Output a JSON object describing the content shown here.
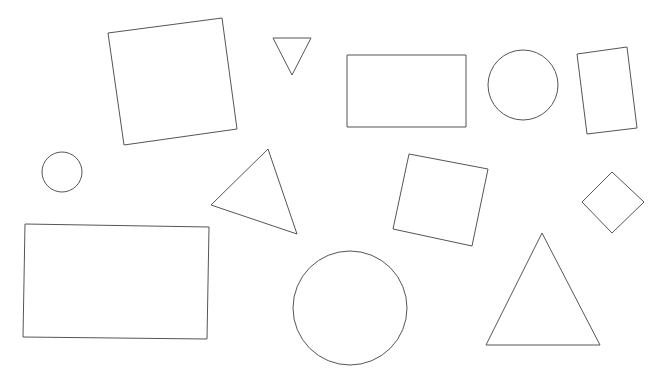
{
  "canvas": {
    "width": 666,
    "height": 387,
    "background": "#ffffff",
    "stroke_color": "#555555"
  },
  "shapes": [
    {
      "id": "square-1",
      "type": "polygon",
      "kind": "square",
      "points": [
        [
          108,
          33
        ],
        [
          222,
          18
        ],
        [
          237,
          129
        ],
        [
          124,
          145
        ]
      ]
    },
    {
      "id": "triangle-1",
      "type": "polygon",
      "kind": "triangle",
      "points": [
        [
          273,
          38
        ],
        [
          311,
          38
        ],
        [
          292,
          75
        ]
      ]
    },
    {
      "id": "rectangle-1",
      "type": "polygon",
      "kind": "rectangle",
      "points": [
        [
          347,
          55
        ],
        [
          466,
          55
        ],
        [
          466,
          127
        ],
        [
          347,
          127
        ]
      ]
    },
    {
      "id": "circle-1",
      "type": "circle",
      "kind": "circle",
      "cx": 523,
      "cy": 85,
      "r": 35
    },
    {
      "id": "rectangle-2",
      "type": "polygon",
      "kind": "rectangle",
      "points": [
        [
          577,
          54
        ],
        [
          627,
          47
        ],
        [
          637,
          128
        ],
        [
          587,
          134
        ]
      ]
    },
    {
      "id": "circle-2",
      "type": "circle",
      "kind": "circle",
      "cx": 62,
      "cy": 172,
      "r": 20
    },
    {
      "id": "triangle-2",
      "type": "polygon",
      "kind": "triangle",
      "points": [
        [
          268,
          149
        ],
        [
          211,
          205
        ],
        [
          297,
          234
        ]
      ]
    },
    {
      "id": "square-2",
      "type": "polygon",
      "kind": "square",
      "points": [
        [
          409,
          154
        ],
        [
          488,
          169
        ],
        [
          472,
          246
        ],
        [
          393,
          229
        ]
      ]
    },
    {
      "id": "diamond-1",
      "type": "polygon",
      "kind": "square",
      "points": [
        [
          612,
          172
        ],
        [
          644,
          202
        ],
        [
          612,
          233
        ],
        [
          582,
          202
        ]
      ]
    },
    {
      "id": "rectangle-3",
      "type": "polygon",
      "kind": "rectangle",
      "points": [
        [
          25,
          224
        ],
        [
          209,
          227
        ],
        [
          207,
          339
        ],
        [
          23,
          337
        ]
      ]
    },
    {
      "id": "circle-3",
      "type": "circle",
      "kind": "circle",
      "cx": 350,
      "cy": 308,
      "r": 57
    },
    {
      "id": "triangle-3",
      "type": "polygon",
      "kind": "triangle",
      "points": [
        [
          542,
          233
        ],
        [
          600,
          345
        ],
        [
          486,
          345
        ]
      ]
    }
  ]
}
